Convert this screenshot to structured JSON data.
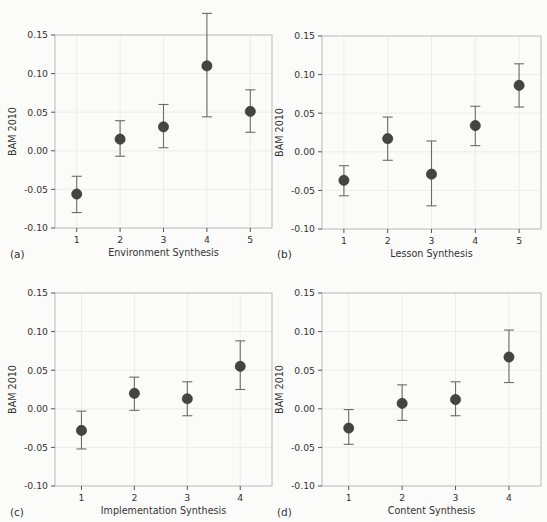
{
  "figure": {
    "background_color": "#fbfbfa",
    "marker_color": "#444444",
    "errorbar_color": "#6b6b6b",
    "gridline_color": "#ececec",
    "frame_color": "#b9b9b9",
    "text_color": "#333333"
  },
  "chart_data": [
    {
      "type": "scatter",
      "panel": "a",
      "panel_tag": "(a)",
      "title": "",
      "xlabel": "Environment Synthesis",
      "ylabel": "BAM 2010",
      "x": [
        1,
        2,
        3,
        4,
        5
      ],
      "xtick_labels": [
        "1",
        "2",
        "3",
        "4",
        "5"
      ],
      "values": [
        -0.056,
        0.015,
        0.031,
        0.11,
        0.051
      ],
      "err_low": [
        -0.08,
        -0.007,
        0.004,
        0.044,
        0.024
      ],
      "err_high": [
        -0.033,
        0.039,
        0.06,
        0.178,
        0.079
      ],
      "ytick_labels": [
        "0.15",
        "0.10",
        "0.05",
        "0.00",
        "-0.05",
        "-0.10"
      ],
      "yticks": [
        0.15,
        0.1,
        0.05,
        0.0,
        -0.05,
        -0.1
      ],
      "ylim": [
        -0.1,
        0.15
      ],
      "xlim": [
        0.5,
        5.5
      ],
      "grid": true,
      "legend": "none"
    },
    {
      "type": "scatter",
      "panel": "b",
      "panel_tag": "(b)",
      "title": "",
      "xlabel": "Lesson Synthesis",
      "ylabel": "BAM 2010",
      "x": [
        1,
        2,
        3,
        4,
        5
      ],
      "xtick_labels": [
        "1",
        "2",
        "3",
        "4",
        "5"
      ],
      "values": [
        -0.037,
        0.017,
        -0.029,
        0.034,
        0.086
      ],
      "err_low": [
        -0.057,
        -0.011,
        -0.07,
        0.008,
        0.058
      ],
      "err_high": [
        -0.018,
        0.045,
        0.014,
        0.059,
        0.114
      ],
      "ytick_labels": [
        "0.15",
        "0.10",
        "0.05",
        "0.00",
        "-0.05",
        "-0.10"
      ],
      "yticks": [
        0.15,
        0.1,
        0.05,
        0.0,
        -0.05,
        -0.1
      ],
      "ylim": [
        -0.1,
        0.15
      ],
      "xlim": [
        0.5,
        5.5
      ],
      "grid": true,
      "legend": "none"
    },
    {
      "type": "scatter",
      "panel": "c",
      "panel_tag": "(c)",
      "title": "",
      "xlabel": "Implementation Synthesis",
      "ylabel": "BAM 2010",
      "x": [
        1,
        2,
        3,
        4
      ],
      "xtick_labels": [
        "1",
        "2",
        "3",
        "4"
      ],
      "values": [
        -0.028,
        0.02,
        0.013,
        0.055
      ],
      "err_low": [
        -0.052,
        -0.002,
        -0.009,
        0.025
      ],
      "err_high": [
        -0.003,
        0.041,
        0.035,
        0.088
      ],
      "ytick_labels": [
        "0.15",
        "0.10",
        "0.05",
        "0.00",
        "-0.05",
        "-0.10"
      ],
      "yticks": [
        0.15,
        0.1,
        0.05,
        0.0,
        -0.05,
        -0.1
      ],
      "ylim": [
        -0.1,
        0.15
      ],
      "xlim": [
        0.5,
        4.6
      ],
      "grid": true,
      "legend": "none"
    },
    {
      "type": "scatter",
      "panel": "d",
      "panel_tag": "(d)",
      "title": "",
      "xlabel": "Content Synthesis",
      "ylabel": "BAM 2010",
      "x": [
        1,
        2,
        3,
        4
      ],
      "xtick_labels": [
        "1",
        "2",
        "3",
        "4"
      ],
      "values": [
        -0.025,
        0.007,
        0.012,
        0.067
      ],
      "err_low": [
        -0.046,
        -0.015,
        -0.009,
        0.034
      ],
      "err_high": [
        -0.001,
        0.031,
        0.035,
        0.102
      ],
      "ytick_labels": [
        "0.15",
        "0.10",
        "0.05",
        "0.00",
        "-0.05",
        "-0.10"
      ],
      "yticks": [
        0.15,
        0.1,
        0.05,
        0.0,
        -0.05,
        -0.1
      ],
      "ylim": [
        -0.1,
        0.15
      ],
      "xlim": [
        0.5,
        4.6
      ],
      "grid": true,
      "legend": "none"
    }
  ]
}
